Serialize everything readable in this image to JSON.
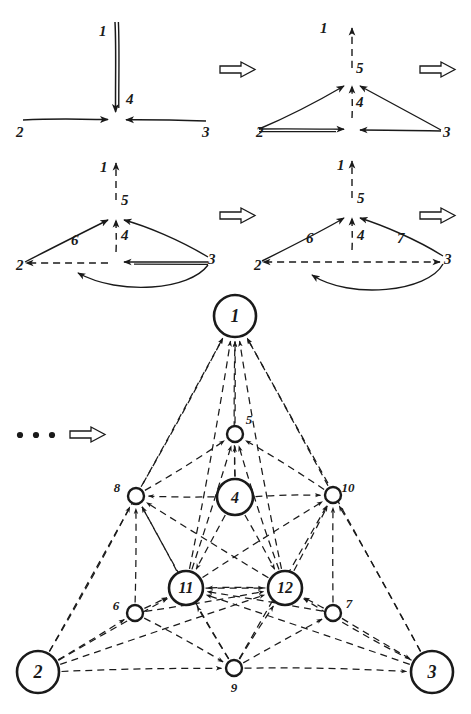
{
  "figure": {
    "kind": "hand-drawn graph rewriting / mesh refinement sequence",
    "ink_color": "#1a1a1a",
    "background_color": "#ffffff",
    "ellipsis": "• • •",
    "transition_arrow_glyph": "⇒"
  },
  "panels": [
    {
      "id": "panel-1",
      "caption": "",
      "node_labels": [
        "1",
        "4",
        "2",
        "3"
      ],
      "labels": [
        {
          "text": "1",
          "x": 99,
          "y": 36
        },
        {
          "text": "4",
          "x": 126,
          "y": 104
        },
        {
          "text": "2",
          "x": 16,
          "y": 137
        },
        {
          "text": "3",
          "x": 202,
          "y": 137
        }
      ]
    },
    {
      "id": "panel-2",
      "caption": "",
      "node_labels": [
        "1",
        "5",
        "4",
        "2",
        "3"
      ],
      "labels": [
        {
          "text": "1",
          "x": 320,
          "y": 33
        },
        {
          "text": "5",
          "x": 356,
          "y": 73
        },
        {
          "text": "4",
          "x": 356,
          "y": 107
        },
        {
          "text": "2",
          "x": 256,
          "y": 137
        },
        {
          "text": "3",
          "x": 443,
          "y": 137
        }
      ]
    },
    {
      "id": "panel-3",
      "caption": "",
      "node_labels": [
        "1",
        "5",
        "4",
        "6",
        "2",
        "3"
      ],
      "labels": [
        {
          "text": "1",
          "x": 100,
          "y": 172
        },
        {
          "text": "5",
          "x": 121,
          "y": 205
        },
        {
          "text": "4",
          "x": 121,
          "y": 240
        },
        {
          "text": "6",
          "x": 71,
          "y": 245
        },
        {
          "text": "2",
          "x": 16,
          "y": 270
        },
        {
          "text": "3",
          "x": 208,
          "y": 264
        }
      ]
    },
    {
      "id": "panel-4",
      "caption": "",
      "node_labels": [
        "1",
        "5",
        "4",
        "6",
        "7",
        "2",
        "3"
      ],
      "labels": [
        {
          "text": "1",
          "x": 337,
          "y": 170
        },
        {
          "text": "5",
          "x": 357,
          "y": 203
        },
        {
          "text": "4",
          "x": 357,
          "y": 240
        },
        {
          "text": "6",
          "x": 306,
          "y": 243
        },
        {
          "text": "7",
          "x": 397,
          "y": 243
        },
        {
          "text": "2",
          "x": 254,
          "y": 270
        },
        {
          "text": "3",
          "x": 444,
          "y": 264
        }
      ]
    }
  ],
  "arrows": [
    {
      "name": "arrow-row1-mid",
      "x": 220,
      "y": 62
    },
    {
      "name": "arrow-row1-end",
      "x": 420,
      "y": 62
    },
    {
      "name": "arrow-row2-mid",
      "x": 220,
      "y": 208
    },
    {
      "name": "arrow-row2-end",
      "x": 420,
      "y": 208
    },
    {
      "name": "arrow-final",
      "x": 70,
      "y": 427
    }
  ],
  "final_graph": {
    "type": "directed-graph",
    "nodes": [
      {
        "id": "1",
        "label": "1",
        "cx": 235,
        "cy": 316,
        "r": 21,
        "big": true,
        "label_inside": true
      },
      {
        "id": "2",
        "label": "2",
        "cx": 38,
        "cy": 672,
        "r": 21,
        "big": true,
        "label_inside": true
      },
      {
        "id": "3",
        "label": "3",
        "cx": 432,
        "cy": 672,
        "r": 21,
        "big": true,
        "label_inside": true
      },
      {
        "id": "4",
        "label": "4",
        "cx": 235,
        "cy": 497,
        "r": 18,
        "big": true,
        "label_inside": true
      },
      {
        "id": "11",
        "label": "11",
        "cx": 186,
        "cy": 588,
        "r": 17,
        "big": true,
        "label_inside": true
      },
      {
        "id": "12",
        "label": "12",
        "cx": 285,
        "cy": 588,
        "r": 17,
        "big": true,
        "label_inside": true
      },
      {
        "id": "5",
        "label": "5",
        "cx": 235,
        "cy": 434,
        "r": 8,
        "big": false,
        "label_inside": false,
        "label_x": 249,
        "label_y": 424
      },
      {
        "id": "8",
        "label": "8",
        "cx": 136,
        "cy": 496,
        "r": 8,
        "big": false,
        "label_inside": false,
        "label_x": 117,
        "label_y": 492
      },
      {
        "id": "10",
        "label": "10",
        "cx": 333,
        "cy": 495,
        "r": 8,
        "big": false,
        "label_inside": false,
        "label_x": 348,
        "label_y": 492
      },
      {
        "id": "6",
        "label": "6",
        "cx": 135,
        "cy": 613,
        "r": 8,
        "big": false,
        "label_inside": false,
        "label_x": 116,
        "label_y": 610
      },
      {
        "id": "7",
        "label": "7",
        "cx": 333,
        "cy": 613,
        "r": 8,
        "big": false,
        "label_inside": false,
        "label_x": 349,
        "label_y": 608
      },
      {
        "id": "9",
        "label": "9",
        "cx": 234,
        "cy": 668,
        "r": 8,
        "big": false,
        "label_inside": false,
        "label_x": 234,
        "label_y": 692
      }
    ],
    "edges": [
      {
        "from": "5",
        "to": "1"
      },
      {
        "from": "8",
        "to": "1"
      },
      {
        "from": "10",
        "to": "1"
      },
      {
        "from": "11",
        "to": "1"
      },
      {
        "from": "12",
        "to": "1"
      },
      {
        "from": "4",
        "to": "1"
      },
      {
        "from": "2",
        "to": "1"
      },
      {
        "from": "3",
        "to": "1"
      },
      {
        "from": "4",
        "to": "5"
      },
      {
        "from": "8",
        "to": "5"
      },
      {
        "from": "10",
        "to": "5"
      },
      {
        "from": "11",
        "to": "5"
      },
      {
        "from": "12",
        "to": "5"
      },
      {
        "from": "4",
        "to": "8"
      },
      {
        "from": "4",
        "to": "10"
      },
      {
        "from": "6",
        "to": "8"
      },
      {
        "from": "11",
        "to": "8"
      },
      {
        "from": "2",
        "to": "8"
      },
      {
        "from": "12",
        "to": "8"
      },
      {
        "from": "9",
        "to": "8"
      },
      {
        "from": "7",
        "to": "10"
      },
      {
        "from": "12",
        "to": "10"
      },
      {
        "from": "3",
        "to": "10"
      },
      {
        "from": "11",
        "to": "10"
      },
      {
        "from": "9",
        "to": "10"
      },
      {
        "from": "4",
        "to": "11"
      },
      {
        "from": "4",
        "to": "12"
      },
      {
        "from": "6",
        "to": "11"
      },
      {
        "from": "9",
        "to": "11"
      },
      {
        "from": "12",
        "to": "11"
      },
      {
        "from": "11",
        "to": "12"
      },
      {
        "from": "7",
        "to": "12"
      },
      {
        "from": "9",
        "to": "12"
      },
      {
        "from": "2",
        "to": "11"
      },
      {
        "from": "3",
        "to": "12"
      },
      {
        "from": "2",
        "to": "6"
      },
      {
        "from": "6",
        "to": "9"
      },
      {
        "from": "9",
        "to": "7"
      },
      {
        "from": "7",
        "to": "3"
      },
      {
        "from": "2",
        "to": "9"
      },
      {
        "from": "9",
        "to": "3"
      },
      {
        "from": "6",
        "to": "12"
      },
      {
        "from": "7",
        "to": "11"
      },
      {
        "from": "2",
        "to": "12"
      },
      {
        "from": "3",
        "to": "11"
      }
    ]
  }
}
